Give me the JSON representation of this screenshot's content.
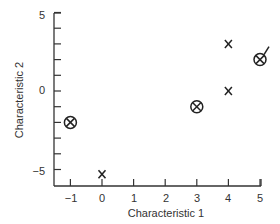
{
  "chart_data": {
    "type": "scatter",
    "title": "",
    "xlabel": "Characteristic 1",
    "ylabel": "Characteristic 2",
    "xlim": [
      -1.5,
      5
    ],
    "ylim": [
      -5.9,
      5
    ],
    "xticks": [
      -1,
      0,
      1,
      2,
      3,
      4,
      5
    ],
    "yticks_labeled": [
      5,
      0,
      -5
    ],
    "yticks_minor": [
      4,
      3,
      2,
      1,
      -1,
      -2,
      -3,
      -4
    ],
    "grid": false,
    "series": [
      {
        "name": "circled-x",
        "marker": "circle-x",
        "points": [
          [
            -1,
            -2
          ],
          [
            3,
            -1
          ],
          [
            5,
            2
          ]
        ]
      },
      {
        "name": "x",
        "marker": "x",
        "points": [
          [
            0,
            -5.3
          ],
          [
            4,
            3
          ],
          [
            4,
            0
          ]
        ]
      }
    ],
    "annotations": [
      "short line segment attached to circled point at (5, 2)"
    ]
  },
  "labels": {
    "xlabel": "Characteristic 1",
    "ylabel": "Characteristic 2",
    "x_ticks": [
      "−1",
      "0",
      "1",
      "2",
      "3",
      "4",
      "5"
    ],
    "y_ticks": [
      "5",
      "0",
      "−5"
    ]
  }
}
